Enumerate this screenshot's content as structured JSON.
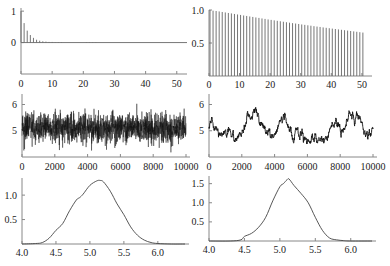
{
  "chart_data": [
    {
      "id": "acf_left",
      "type": "bar",
      "title": "",
      "xlabel": "",
      "ylabel": "",
      "xlim": [
        0,
        52
      ],
      "ylim": [
        -1,
        1.1
      ],
      "xticks": [
        "0",
        "10",
        "20",
        "30",
        "40",
        "50"
      ],
      "yticks": [
        "0",
        "1"
      ],
      "lags": [
        0,
        1,
        2,
        3,
        4,
        5,
        6,
        7,
        8,
        9,
        10,
        11,
        12,
        13,
        14,
        15,
        16,
        17,
        18,
        19,
        20,
        21,
        22,
        23,
        24,
        25,
        26,
        27,
        28,
        29,
        30,
        31,
        32,
        33,
        34,
        35,
        36,
        37,
        38,
        39,
        40,
        41,
        42,
        43,
        44,
        45,
        46,
        47,
        48,
        49,
        50
      ],
      "values": [
        1.0,
        0.62,
        0.38,
        0.24,
        0.15,
        0.09,
        0.06,
        0.04,
        0.03,
        0.02,
        0.02,
        0.01,
        0.01,
        0.01,
        0.0,
        0.0,
        0.0,
        0.0,
        0.0,
        0.0,
        0.0,
        -0.01,
        -0.01,
        -0.01,
        -0.01,
        0.0,
        0.0,
        0.0,
        0.0,
        0.0,
        0.0,
        0.0,
        0.0,
        0.0,
        0.0,
        0.0,
        0.0,
        0.0,
        0.0,
        0.0,
        0.0,
        0.0,
        0.0,
        0.0,
        0.0,
        0.0,
        0.0,
        0.0,
        0.0,
        0.0,
        0.0
      ]
    },
    {
      "id": "acf_right",
      "type": "bar",
      "title": "",
      "xlabel": "",
      "ylabel": "",
      "xlim": [
        0,
        52
      ],
      "ylim": [
        0,
        1.0
      ],
      "xticks": [
        "0",
        "10",
        "20",
        "30",
        "40",
        "50"
      ],
      "yticks": [
        "0.5",
        "1.0"
      ],
      "lags": [
        0,
        1,
        2,
        3,
        4,
        5,
        6,
        7,
        8,
        9,
        10,
        11,
        12,
        13,
        14,
        15,
        16,
        17,
        18,
        19,
        20,
        21,
        22,
        23,
        24,
        25,
        26,
        27,
        28,
        29,
        30,
        31,
        32,
        33,
        34,
        35,
        36,
        37,
        38,
        39,
        40,
        41,
        42,
        43,
        44,
        45,
        46,
        47,
        48,
        49,
        50
      ],
      "values": [
        1.0,
        0.99,
        0.985,
        0.978,
        0.97,
        0.963,
        0.955,
        0.948,
        0.94,
        0.932,
        0.925,
        0.917,
        0.91,
        0.902,
        0.895,
        0.887,
        0.88,
        0.872,
        0.865,
        0.857,
        0.85,
        0.843,
        0.836,
        0.829,
        0.822,
        0.815,
        0.808,
        0.801,
        0.795,
        0.788,
        0.781,
        0.775,
        0.768,
        0.762,
        0.755,
        0.749,
        0.743,
        0.736,
        0.73,
        0.724,
        0.718,
        0.712,
        0.706,
        0.7,
        0.694,
        0.688,
        0.682,
        0.676,
        0.67,
        0.664,
        0.658
      ]
    },
    {
      "id": "trace_left",
      "type": "line",
      "title": "",
      "xlabel": "",
      "ylabel": "",
      "xlim": [
        0,
        10000
      ],
      "ylim": [
        4.0,
        6.4
      ],
      "xticks": [
        "0",
        "2000",
        "4000",
        "6000",
        "8000",
        "10000"
      ],
      "yticks": [
        "5",
        "6"
      ],
      "description": "Rapidly mixing trace centered near 5.1, range about 4.3-6.2",
      "mean": 5.1,
      "min": 4.3,
      "max": 6.2
    },
    {
      "id": "trace_right",
      "type": "line",
      "title": "",
      "xlabel": "",
      "ylabel": "",
      "xlim": [
        0,
        10000
      ],
      "ylim": [
        4.0,
        6.4
      ],
      "xticks": [
        "0",
        "2000",
        "4000",
        "6000",
        "8000",
        "10000"
      ],
      "yticks": [
        "5",
        "6"
      ],
      "description": "Slowly mixing trace centered near 5.1, range about 4.5-5.9",
      "mean": 5.1,
      "min": 4.5,
      "max": 5.9
    },
    {
      "id": "density_left",
      "type": "line",
      "title": "",
      "xlabel": "",
      "ylabel": "",
      "xlim": [
        4.0,
        6.4
      ],
      "ylim": [
        0,
        1.35
      ],
      "xticks": [
        "4.0",
        "4.5",
        "5.0",
        "5.5",
        "6.0"
      ],
      "yticks": [
        "0.5",
        "1.0"
      ],
      "x": [
        4.0,
        4.2,
        4.3,
        4.4,
        4.5,
        4.6,
        4.7,
        4.8,
        4.85,
        4.9,
        5.0,
        5.1,
        5.15,
        5.2,
        5.3,
        5.4,
        5.5,
        5.6,
        5.7,
        5.8,
        5.9,
        6.0,
        6.2,
        6.4
      ],
      "y": [
        0.0,
        0.01,
        0.03,
        0.12,
        0.28,
        0.42,
        0.68,
        0.9,
        0.95,
        1.02,
        1.2,
        1.29,
        1.3,
        1.27,
        1.08,
        0.82,
        0.6,
        0.35,
        0.18,
        0.08,
        0.03,
        0.01,
        0.0,
        0.0
      ]
    },
    {
      "id": "density_right",
      "type": "line",
      "title": "",
      "xlabel": "",
      "ylabel": "",
      "xlim": [
        4.0,
        6.3
      ],
      "ylim": [
        0,
        1.7
      ],
      "xticks": [
        "4.0",
        "4.5",
        "5.0",
        "5.5",
        "6.0"
      ],
      "yticks": [
        "0.5",
        "1.0",
        "1.5"
      ],
      "x": [
        4.0,
        4.3,
        4.45,
        4.5,
        4.6,
        4.7,
        4.8,
        4.9,
        5.0,
        5.05,
        5.1,
        5.13,
        5.2,
        5.3,
        5.4,
        5.5,
        5.6,
        5.7,
        5.8,
        5.9,
        6.0,
        6.3
      ],
      "y": [
        0.0,
        0.0,
        0.03,
        0.12,
        0.2,
        0.36,
        0.62,
        1.05,
        1.42,
        1.5,
        1.6,
        1.62,
        1.45,
        1.24,
        1.0,
        0.62,
        0.28,
        0.08,
        0.03,
        0.01,
        0.0,
        0.0
      ]
    }
  ]
}
